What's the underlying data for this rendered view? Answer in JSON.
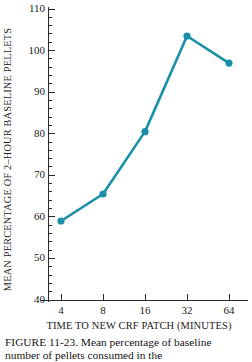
{
  "figure": {
    "caption_lines": [
      "FIGURE 11-23.  Mean percentage of baseline",
      "number of pellets consumed in the"
    ]
  },
  "chart_data": {
    "type": "line",
    "title": "",
    "xlabel": "TIME TO NEW CRF PATCH (MINUTES)",
    "ylabel": "MEAN PERCENTAGE OF 2–HOUR BASELINE PELLETS",
    "categories": [
      "4",
      "8",
      "16",
      "32",
      "64"
    ],
    "x": [
      4,
      8,
      16,
      32,
      64
    ],
    "x_scale": "log2-evenly-spaced",
    "values": [
      59,
      65.5,
      80.5,
      103.5,
      97
    ],
    "ylim": [
      40,
      110
    ],
    "ytick_labels": [
      "40",
      "50",
      "60",
      "70",
      "80",
      "90",
      "100",
      "110"
    ],
    "ytick_values": [
      40,
      50,
      60,
      70,
      80,
      90,
      100,
      110
    ],
    "yminor_step": 2,
    "xtick_labels": [
      "4",
      "8",
      "16",
      "32",
      "64"
    ],
    "grid": false,
    "legend": "none",
    "series": [
      {
        "name": "mean percentage of baseline pellets",
        "color": "#1a8fa8",
        "marker": "circle",
        "values": [
          59,
          65.5,
          80.5,
          103.5,
          97
        ]
      }
    ]
  }
}
